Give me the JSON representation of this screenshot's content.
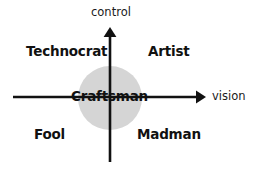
{
  "diagram": {
    "background_color": "#ffffff",
    "ink_color": "#111111",
    "center_circle": {
      "name": "craftsman-zone",
      "fill_color": "#d5d5d5",
      "cx": 110,
      "cy": 98,
      "r": 32
    },
    "axes": {
      "vertical": {
        "label": "control",
        "orientation": "vertical",
        "arrow_direction": "up",
        "x": 110,
        "top": 27,
        "bottom": 162
      },
      "horizontal": {
        "label": "vision",
        "orientation": "horizontal",
        "arrow_direction": "right",
        "y": 97,
        "left": 13,
        "right": 206
      }
    },
    "axis_labels": {
      "control": "control",
      "vision": "vision"
    },
    "center_label": "Craftsman",
    "quadrants": [
      {
        "key": "top_left",
        "label": "Technocrat",
        "vision": "low",
        "control": "high"
      },
      {
        "key": "top_right",
        "label": "Artist",
        "vision": "high",
        "control": "high"
      },
      {
        "key": "bottom_left",
        "label": "Fool",
        "vision": "low",
        "control": "low"
      },
      {
        "key": "bottom_right",
        "label": "Madman",
        "vision": "high",
        "control": "low"
      }
    ]
  },
  "chart_data": {
    "type": "scatter",
    "xlabel": "vision",
    "ylabel": "control",
    "xlim": [
      -1,
      1
    ],
    "ylim": [
      -1,
      1
    ],
    "grid": false,
    "legend": null,
    "annotations": [
      {
        "text": "Technocrat",
        "x": -0.55,
        "y": 0.6
      },
      {
        "text": "Artist",
        "x": 0.45,
        "y": 0.6
      },
      {
        "text": "Craftsman",
        "x": 0.0,
        "y": 0.0
      },
      {
        "text": "Fool",
        "x": -0.55,
        "y": -0.45
      },
      {
        "text": "Madman",
        "x": 0.45,
        "y": -0.45
      },
      {
        "text": "control",
        "x": 0.0,
        "y": 0.95
      },
      {
        "text": "vision",
        "x": 1.0,
        "y": 0.0
      }
    ]
  }
}
